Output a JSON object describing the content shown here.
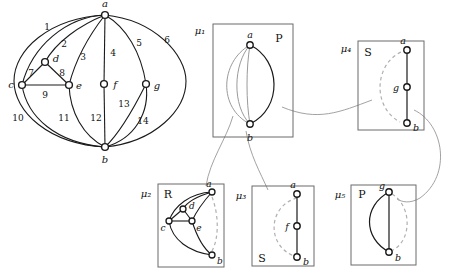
{
  "figure": {
    "colors": {
      "edge": "#1a1a1a",
      "virtual_edge": "#9a9a9a",
      "dashed_virtual": "#b0b0b0",
      "box_border": "#6b6b6b",
      "connector": "#8a8a8a",
      "vertex_fill": "#ffffff",
      "label": "#111111"
    }
  },
  "graph": {
    "name": "original-graph",
    "vertices": [
      {
        "id": "a",
        "label": "a",
        "x": 105,
        "y": 15,
        "lx": 105,
        "ly": 7
      },
      {
        "id": "b",
        "label": "b",
        "x": 105,
        "y": 147,
        "lx": 105,
        "ly": 163
      },
      {
        "id": "c",
        "label": "c",
        "x": 22,
        "y": 85,
        "lx": 11,
        "ly": 85
      },
      {
        "id": "d",
        "label": "d",
        "x": 45,
        "y": 62,
        "lx": 56,
        "ly": 60
      },
      {
        "id": "e",
        "label": "e",
        "x": 69,
        "y": 85,
        "lx": 79,
        "ly": 86
      },
      {
        "id": "f",
        "label": "f",
        "x": 104,
        "y": 84,
        "lx": 115,
        "ly": 85
      },
      {
        "id": "g",
        "label": "g",
        "x": 146,
        "y": 84,
        "lx": 157,
        "ly": 86
      }
    ],
    "edges": [
      {
        "id": 1,
        "label": "1",
        "from": "a",
        "to": "c",
        "lx": 47,
        "ly": 26
      },
      {
        "id": 2,
        "label": "2",
        "from": "a",
        "to": "d",
        "lx": 64,
        "ly": 43
      },
      {
        "id": 3,
        "label": "3",
        "from": "a",
        "to": "e",
        "lx": 83,
        "ly": 56
      },
      {
        "id": 4,
        "label": "4",
        "from": "a",
        "to": "f",
        "lx": 112,
        "ly": 52
      },
      {
        "id": 5,
        "label": "5",
        "from": "a",
        "to": "g",
        "lx": 139,
        "ly": 42
      },
      {
        "id": 6,
        "label": "6",
        "from": "a",
        "to": "b",
        "lx": 166,
        "ly": 39
      },
      {
        "id": 7,
        "label": "7",
        "from": "c",
        "to": "d",
        "lx": 30,
        "ly": 73
      },
      {
        "id": 8,
        "label": "8",
        "from": "d",
        "to": "e",
        "lx": 62,
        "ly": 73
      },
      {
        "id": 9,
        "label": "9",
        "from": "c",
        "to": "e",
        "lx": 45,
        "ly": 95
      },
      {
        "id": 10,
        "label": "10",
        "from": "c",
        "to": "b",
        "lx": 18,
        "ly": 117
      },
      {
        "id": 11,
        "label": "11",
        "from": "e",
        "to": "b",
        "lx": 64,
        "ly": 117
      },
      {
        "id": 12,
        "label": "12",
        "from": "f",
        "to": "b",
        "lx": 97,
        "ly": 117
      },
      {
        "id": 13,
        "label": "13",
        "from": "g",
        "to": "b",
        "lx": 123,
        "ly": 104
      },
      {
        "id": 14,
        "label": "14",
        "from": "g",
        "to": "b",
        "lx": 142,
        "ly": 120
      }
    ]
  },
  "spqr_tree": {
    "nodes": [
      {
        "id": "mu1",
        "label": "μ₁",
        "type": "P",
        "type_label": "P",
        "label_x": 203,
        "label_y": 31,
        "box": {
          "x": 213,
          "y": 24,
          "w": 80,
          "h": 113
        },
        "type_label_x": 279,
        "type_label_y": 38,
        "vertices": [
          {
            "id": "a",
            "label": "a",
            "x": 250,
            "y": 45,
            "lx": 250,
            "ly": 36
          },
          {
            "id": "b",
            "label": "b",
            "x": 250,
            "y": 124,
            "lx": 250,
            "ly": 140
          }
        ]
      },
      {
        "id": "mu2",
        "label": "μ₂",
        "type": "R",
        "type_label": "R",
        "label_x": 147,
        "label_y": 196,
        "box": {
          "x": 158,
          "y": 184,
          "w": 66,
          "h": 83
        },
        "type_label_x": 167,
        "type_label_y": 196,
        "vertices": [
          {
            "id": "a",
            "label": "a",
            "x": 212,
            "y": 192,
            "lx": 210,
            "ly": 184
          },
          {
            "id": "d",
            "label": "d",
            "x": 183,
            "y": 209,
            "lx": 192,
            "ly": 208
          },
          {
            "id": "c",
            "label": "c",
            "x": 169,
            "y": 221,
            "lx": 162,
            "ly": 228
          },
          {
            "id": "e",
            "label": "e",
            "x": 192,
            "y": 221,
            "lx": 199,
            "ly": 228
          },
          {
            "id": "b",
            "label": "b",
            "x": 212,
            "y": 255,
            "lx": 219,
            "ly": 260
          }
        ]
      },
      {
        "id": "mu3",
        "label": "μ₃",
        "type": "S",
        "type_label": "S",
        "label_x": 242,
        "label_y": 196,
        "box": {
          "x": 252,
          "y": 186,
          "w": 62,
          "h": 80
        },
        "type_label_x": 261,
        "type_label_y": 259,
        "vertices": [
          {
            "id": "a",
            "label": "a",
            "x": 297,
            "y": 194,
            "lx": 296,
            "ly": 186
          },
          {
            "id": "f",
            "label": "f",
            "x": 297,
            "y": 226,
            "lx": 287,
            "ly": 228
          },
          {
            "id": "b",
            "label": "b",
            "x": 297,
            "y": 257,
            "lx": 305,
            "ly": 263
          }
        ]
      },
      {
        "id": "mu4",
        "label": "μ₄",
        "type": "S",
        "type_label": "S",
        "label_x": 348,
        "label_y": 49,
        "box": {
          "x": 358,
          "y": 41,
          "w": 66,
          "h": 89
        },
        "type_label_x": 367,
        "type_label_y": 52,
        "vertices": [
          {
            "id": "a",
            "label": "a",
            "x": 407,
            "y": 50,
            "lx": 405,
            "ly": 42
          },
          {
            "id": "g",
            "label": "g",
            "x": 407,
            "y": 87,
            "lx": 396,
            "ly": 88
          },
          {
            "id": "b",
            "label": "b",
            "x": 407,
            "y": 123,
            "lx": 415,
            "ly": 129
          }
        ]
      },
      {
        "id": "mu5",
        "label": "μ₅",
        "type": "P",
        "type_label": "P",
        "label_x": 341,
        "label_y": 196,
        "box": {
          "x": 351,
          "y": 185,
          "w": 65,
          "h": 80
        },
        "type_label_x": 361,
        "type_label_y": 196,
        "vertices": [
          {
            "id": "g",
            "label": "g",
            "x": 389,
            "y": 192,
            "lx": 381,
            "ly": 186
          },
          {
            "id": "b",
            "label": "b",
            "x": 389,
            "y": 252,
            "lx": 397,
            "ly": 259
          }
        ]
      }
    ],
    "edge_count_mu1": 4,
    "edge_count_mu5": 3
  }
}
